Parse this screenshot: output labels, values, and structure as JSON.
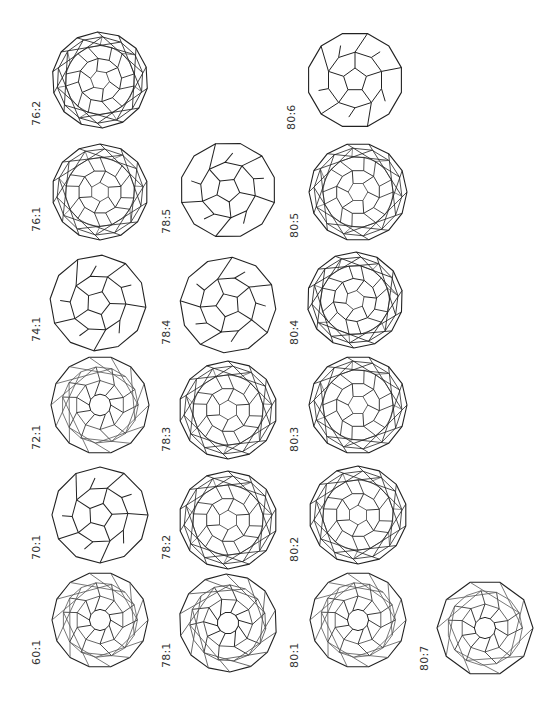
{
  "figure": {
    "title": "",
    "stroke_color": "#222222",
    "inner_stroke_color": "#555555",
    "background": "#ffffff"
  },
  "molecules": [
    {
      "label": "76:2",
      "cx": 100,
      "cy": 80,
      "r": 48,
      "style": "dense",
      "rot": 10,
      "lx": 30,
      "ly": 126
    },
    {
      "label": "80:6",
      "cx": 355,
      "cy": 80,
      "r": 48,
      "style": "open",
      "rot": 0,
      "lx": 285,
      "ly": 130
    },
    {
      "label": "76:1",
      "cx": 100,
      "cy": 192,
      "r": 48,
      "style": "dense",
      "rot": 90,
      "lx": 30,
      "ly": 232
    },
    {
      "label": "78:5",
      "cx": 228,
      "cy": 190,
      "r": 48,
      "style": "open",
      "rot": 30,
      "lx": 160,
      "ly": 234
    },
    {
      "label": "80:5",
      "cx": 358,
      "cy": 192,
      "r": 49,
      "style": "dense",
      "rot": 0,
      "lx": 288,
      "ly": 238
    },
    {
      "label": "74:1",
      "cx": 98,
      "cy": 303,
      "r": 48,
      "style": "open",
      "rot": 20,
      "lx": 30,
      "ly": 342
    },
    {
      "label": "78:4",
      "cx": 228,
      "cy": 305,
      "r": 48,
      "style": "open",
      "rot": 50,
      "lx": 160,
      "ly": 345
    },
    {
      "label": "80:4",
      "cx": 355,
      "cy": 300,
      "r": 48,
      "style": "dense",
      "rot": 40,
      "lx": 288,
      "ly": 345
    },
    {
      "label": "72:1",
      "cx": 100,
      "cy": 405,
      "r": 49,
      "style": "ring",
      "rot": 0,
      "lx": 30,
      "ly": 450
    },
    {
      "label": "78:3",
      "cx": 228,
      "cy": 410,
      "r": 49,
      "style": "dense",
      "rot": 90,
      "lx": 160,
      "ly": 452
    },
    {
      "label": "80:3",
      "cx": 358,
      "cy": 405,
      "r": 49,
      "style": "dense",
      "rot": 0,
      "lx": 288,
      "ly": 452
    },
    {
      "label": "70:1",
      "cx": 100,
      "cy": 515,
      "r": 48,
      "style": "open",
      "rot": 15,
      "lx": 30,
      "ly": 560
    },
    {
      "label": "78:2",
      "cx": 228,
      "cy": 520,
      "r": 49,
      "style": "dense",
      "rot": 90,
      "lx": 160,
      "ly": 560
    },
    {
      "label": "80:2",
      "cx": 358,
      "cy": 515,
      "r": 49,
      "style": "dense",
      "rot": 90,
      "lx": 288,
      "ly": 562
    },
    {
      "label": "60:1",
      "cx": 100,
      "cy": 620,
      "r": 48,
      "style": "ring",
      "rot": 0,
      "lx": 30,
      "ly": 665
    },
    {
      "label": "78:1",
      "cx": 228,
      "cy": 623,
      "r": 49,
      "style": "ring",
      "rot": -15,
      "lx": 160,
      "ly": 668
    },
    {
      "label": "80:1",
      "cx": 358,
      "cy": 620,
      "r": 48,
      "style": "ring",
      "rot": 0,
      "lx": 288,
      "ly": 668
    },
    {
      "label": "80:7",
      "cx": 485,
      "cy": 628,
      "r": 48,
      "style": "ring10",
      "rot": 0,
      "lx": 418,
      "ly": 671
    }
  ]
}
